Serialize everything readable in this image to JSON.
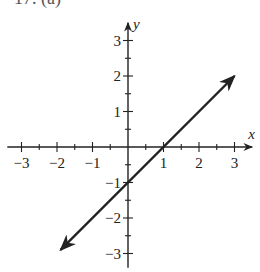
{
  "header": {
    "label": "17. (a)"
  },
  "chart_data": {
    "type": "line",
    "title": "",
    "xlabel": "x",
    "ylabel": "y",
    "xlim": [
      -3.4,
      3.5
    ],
    "ylim": [
      -3.4,
      3.5
    ],
    "grid": false,
    "x_ticks": [
      -3,
      -2,
      -1,
      1,
      2,
      3
    ],
    "y_ticks": [
      -3,
      -2,
      -1,
      1,
      2,
      3
    ],
    "x_tick_labels": [
      "−3",
      "−2",
      "−1",
      "1",
      "2",
      "3"
    ],
    "y_tick_labels": [
      "−3",
      "−2",
      "−1",
      "1",
      "2",
      "3"
    ],
    "minor_ticks_step": 0.5,
    "series": [
      {
        "name": "y = x − 1",
        "equation": "y = x - 1",
        "x": [
          -1.9,
          3.0
        ],
        "y": [
          -2.9,
          2.0
        ],
        "arrows": "both",
        "color": "#222222"
      }
    ]
  },
  "colors": {
    "axis": "#222222",
    "line": "#222222",
    "background": "#ffffff"
  }
}
